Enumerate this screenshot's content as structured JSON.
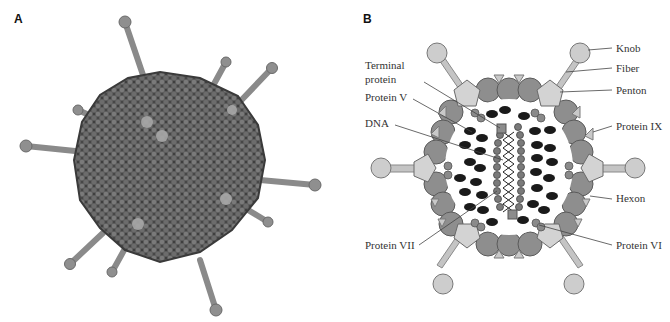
{
  "caption_fragment": "...that make some of the core proteins... (partially cut off)",
  "panels": {
    "a": {
      "letter": "A",
      "description": "3D molecular model of adenovirus particle with fibers"
    },
    "b": {
      "letter": "B",
      "description": "Schematic cross-section of adenovirus virion"
    }
  },
  "labels": {
    "knob": "Knob",
    "fiber": "Fiber",
    "penton": "Penton",
    "terminal_protein_1": "Terminal",
    "terminal_protein_2": "protein",
    "protein_v": "Protein V",
    "dna": "DNA",
    "protein_ix": "Protein IX",
    "hexon": "Hexon",
    "protein_vii": "Protein VII",
    "protein_vi": "Protein VI"
  },
  "colors": {
    "hexon": "#8c8c8c",
    "penton": "#cfcfcf",
    "fiber": "#bdbdbd",
    "core_protein": "#1a1a1a",
    "protein_vii": "#777777",
    "virus_body": "#5a5a5a"
  }
}
